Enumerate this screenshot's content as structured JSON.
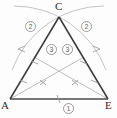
{
  "figure": {
    "type": "geometry-construction"
  },
  "colors": {
    "triangle_stroke": "#3a3a3a",
    "base_stroke": "#4a4a4a",
    "arc_stroke": "#b8b8b8",
    "cevian_stroke": "#b0b0b0",
    "tick_stroke": "#9a9a9a",
    "badge_border": "#9a9a9a",
    "badge_text": "#5f5f5f",
    "label_text": "#2b2b2b",
    "background": "#fdfdfd"
  },
  "vertices": [
    {
      "id": "A",
      "label": "A",
      "x": 10,
      "y": 99
    },
    {
      "id": "C",
      "label": "C",
      "x": 59,
      "y": 16
    },
    {
      "id": "E",
      "label": "E",
      "x": 108,
      "y": 99
    }
  ],
  "steps": [
    {
      "id": "base",
      "label": "1",
      "description": "draw base segment AE"
    },
    {
      "id": "left-arc",
      "label": "2",
      "description": "arc centered at A through E"
    },
    {
      "id": "right-arc",
      "label": "2",
      "description": "arc centered at E through A"
    },
    {
      "id": "cevian-left",
      "label": "3",
      "description": "segment from E to midpoint of AC"
    },
    {
      "id": "cevian-right",
      "label": "3",
      "description": "segment from A to midpoint of CE"
    }
  ],
  "segments": [
    {
      "name": "side-AC",
      "from": "A",
      "to": "C"
    },
    {
      "name": "side-CE",
      "from": "C",
      "to": "E"
    },
    {
      "name": "base-AE",
      "from": "A",
      "to": "E"
    },
    {
      "name": "cevian-A-to-CE",
      "from": "A",
      "to": "midpoint-CE"
    },
    {
      "name": "cevian-E-to-AC",
      "from": "E",
      "to": "midpoint-AC"
    }
  ],
  "tick_marks": [
    {
      "name": "tick-base",
      "on": "base-AE",
      "glyph": "single"
    },
    {
      "name": "tick-upper-AC",
      "on": "side-AC",
      "glyph": "single"
    },
    {
      "name": "tick-lower-AC",
      "on": "side-AC",
      "glyph": "single"
    },
    {
      "name": "tick-upper-CE",
      "on": "side-CE",
      "glyph": "single"
    },
    {
      "name": "tick-lower-CE",
      "on": "side-CE",
      "glyph": "single"
    },
    {
      "name": "tick-cevian-left",
      "on": "cevian-E-to-AC",
      "glyph": "cross"
    },
    {
      "name": "tick-cevian-right",
      "on": "cevian-A-to-CE",
      "glyph": "cross"
    }
  ],
  "arrowheads": [
    {
      "name": "arrow-left-arc",
      "direction": "left"
    },
    {
      "name": "arrow-right-arc",
      "direction": "right"
    }
  ]
}
